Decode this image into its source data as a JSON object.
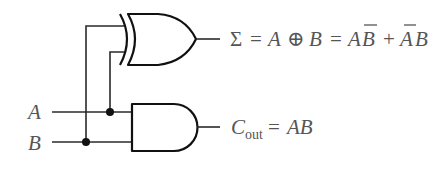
{
  "diagram": {
    "inputs": [
      {
        "label": "A"
      },
      {
        "label": "B"
      }
    ],
    "gates": [
      {
        "type": "XOR",
        "name": "sum-gate"
      },
      {
        "type": "AND",
        "name": "carry-gate"
      }
    ],
    "outputs": {
      "sum": {
        "symbol": "Σ",
        "eq1": "=",
        "expr_a": "A",
        "xor_symbol": "⊕",
        "expr_b": "B",
        "eq2": "=",
        "term1_a": "A",
        "term1_b": "B",
        "plus": "+",
        "term2_a": "A",
        "term2_b": "B"
      },
      "carry": {
        "symbol": "C",
        "subscript": "out",
        "eq": "=",
        "expr": "AB"
      }
    },
    "colors": {
      "line": "#111111",
      "text": "#555555",
      "background": "#ffffff"
    }
  }
}
